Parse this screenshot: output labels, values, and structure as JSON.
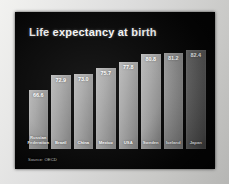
{
  "slide": {
    "title": "Life expectancy at birth",
    "source_note": "Source: OECD",
    "background_color": "#050505",
    "title_color": "#f4f4f4",
    "bar_color": "#a6a6a6",
    "value_label_color": "#ffffff"
  },
  "chart_data": {
    "type": "bar",
    "title": "Life expectancy at birth",
    "xlabel": "",
    "ylabel": "",
    "ylim": [
      0,
      90
    ],
    "grid": false,
    "legend": false,
    "categories": [
      "Russian Federation",
      "Brazil",
      "China",
      "Mexico",
      "USA",
      "Sweden",
      "Iceland",
      "Japan"
    ],
    "values": [
      66.6,
      72.9,
      73.0,
      75.7,
      77.8,
      80.8,
      81.2,
      82.4
    ],
    "value_labels": [
      "66.6",
      "72.9",
      "73.0",
      "75.7",
      "77.8",
      "80.8",
      "81.2",
      "82.4"
    ],
    "annotations": [
      "Source: OECD"
    ]
  },
  "bars": [
    {
      "label": "Russian Federation",
      "value_label": "66.6",
      "height_pct": 57.0,
      "shade": "normal"
    },
    {
      "label": "Brazil",
      "value_label": "72.9",
      "height_pct": 72.0,
      "shade": "normal"
    },
    {
      "label": "China",
      "value_label": "73.0",
      "height_pct": 72.5,
      "shade": "normal"
    },
    {
      "label": "Mexico",
      "value_label": "75.7",
      "height_pct": 79.0,
      "shade": "normal"
    },
    {
      "label": "USA",
      "value_label": "77.8",
      "height_pct": 84.5,
      "shade": "normal"
    },
    {
      "label": "Sweden",
      "value_label": "80.8",
      "height_pct": 92.0,
      "shade": "normal"
    },
    {
      "label": "Iceland",
      "value_label": "81.2",
      "height_pct": 93.0,
      "shade": "dim2"
    },
    {
      "label": "Japan",
      "value_label": "82.4",
      "height_pct": 96.0,
      "shade": "dim"
    }
  ]
}
